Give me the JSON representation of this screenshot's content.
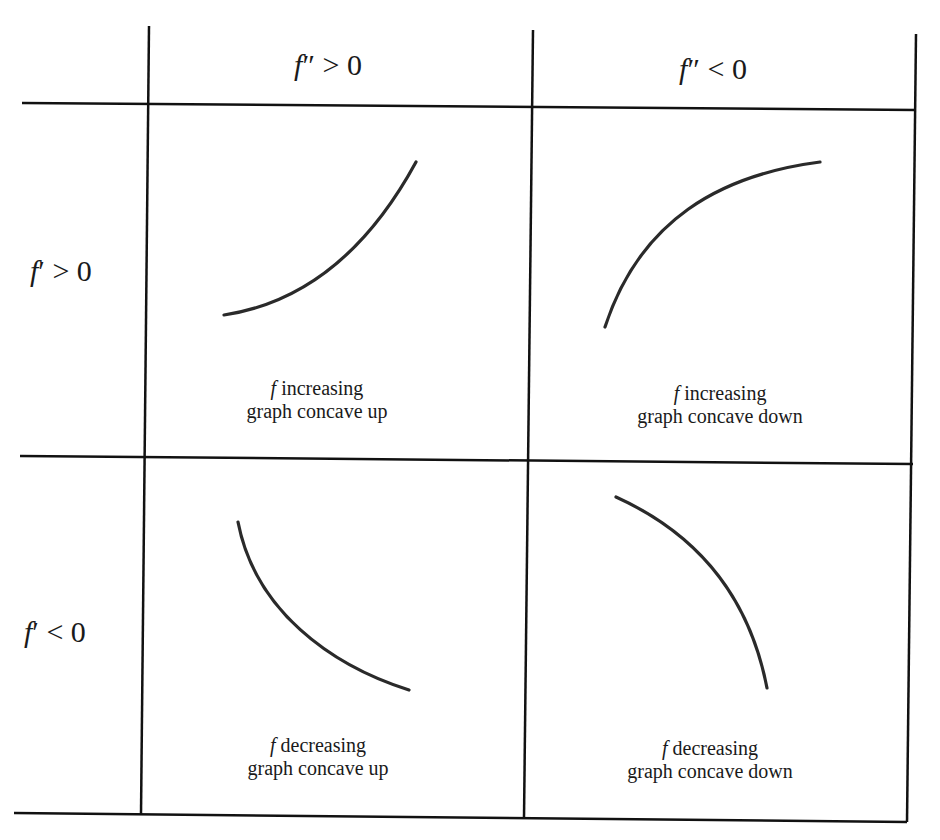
{
  "table": {
    "columns": [
      {
        "label_f": "f",
        "label_rest": "″ > 0",
        "meaning": "second derivative positive"
      },
      {
        "label_f": "f",
        "label_rest": "″ < 0",
        "meaning": "second derivative negative"
      }
    ],
    "rows": [
      {
        "label_f": "f",
        "label_rest": "′ > 0"
      },
      {
        "label_f": "f",
        "label_rest": "′ < 0"
      }
    ],
    "cells": [
      {
        "row": 0,
        "col": 0,
        "line1_f": "f",
        "line1_rest": " increasing",
        "line2": "graph concave up"
      },
      {
        "row": 0,
        "col": 1,
        "line1_f": "f",
        "line1_rest": " increasing",
        "line2": "graph concave down"
      },
      {
        "row": 1,
        "col": 0,
        "line1_f": "f",
        "line1_rest": " decreasing",
        "line2": "graph concave up"
      },
      {
        "row": 1,
        "col": 1,
        "line1_f": "f",
        "line1_rest": " decreasing",
        "line2": "graph concave down"
      }
    ]
  },
  "colors": {
    "line": "#111111",
    "curve": "#2a2a2a",
    "background": "#ffffff"
  }
}
